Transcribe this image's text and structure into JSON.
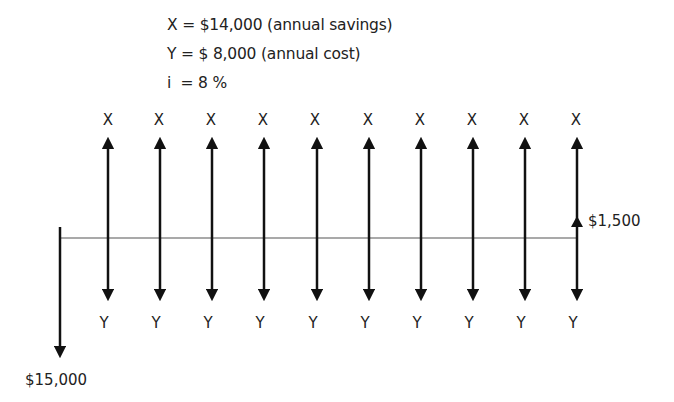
{
  "given": {
    "line1": "X = $14,000 (annual savings)",
    "line2": "Y = $ 8,000 (annual cost)",
    "line3": "i  = 8 %"
  },
  "diagram": {
    "inflow_label": "X",
    "outflow_label": "Y",
    "initial_cost_label": "$15,000",
    "salvage_label": "$1,500",
    "periods": 10,
    "line_color": "#111111",
    "timeline_color": "#555555"
  },
  "x_labels": [
    "X",
    "X",
    "X",
    "X",
    "X",
    "X",
    "X",
    "X",
    "X",
    "X"
  ],
  "y_labels": [
    "Y",
    "Y",
    "Y",
    "Y",
    "Y",
    "Y",
    "Y",
    "Y",
    "Y",
    "Y"
  ]
}
